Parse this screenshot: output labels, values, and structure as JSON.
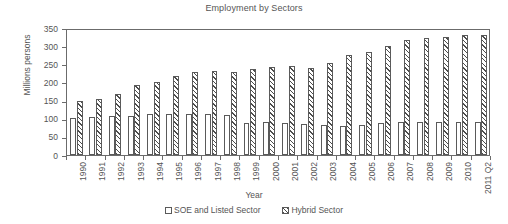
{
  "chart_data": {
    "type": "bar",
    "title": "Employment by Sectors",
    "xlabel": "Year",
    "ylabel": "Millions persons",
    "ylim": [
      0,
      350
    ],
    "ytick_step": 50,
    "yticks": [
      350,
      300,
      250,
      200,
      150,
      100,
      50,
      0
    ],
    "grid": false,
    "legend_position": "bottom",
    "categories": [
      "1990",
      "1991",
      "1992",
      "1993",
      "1994",
      "1995",
      "1996",
      "1997",
      "1998",
      "1999",
      "2000",
      "2001",
      "2002",
      "2003",
      "2004",
      "2005",
      "2006",
      "2007",
      "2008",
      "2009",
      "2010",
      "2011 Q2"
    ],
    "series": [
      {
        "name": "SOE and Listed Sector",
        "pattern": "solid-white",
        "values": [
          103,
          104,
          107,
          108,
          112,
          112,
          112,
          112,
          110,
          88,
          90,
          88,
          85,
          83,
          80,
          82,
          88,
          90,
          92,
          90,
          92,
          92
        ]
      },
      {
        "name": "Hybrid Sector",
        "pattern": "diagonal-hatch",
        "values": [
          150,
          153,
          168,
          193,
          202,
          218,
          230,
          232,
          230,
          238,
          243,
          245,
          240,
          253,
          276,
          285,
          301,
          317,
          322,
          325,
          330,
          330
        ]
      }
    ]
  },
  "legend": {
    "items": [
      {
        "label": "SOE and Listed Sector",
        "swatch": "swatch-white"
      },
      {
        "label": "Hybrid Sector",
        "swatch": "swatch-hatched"
      }
    ]
  }
}
